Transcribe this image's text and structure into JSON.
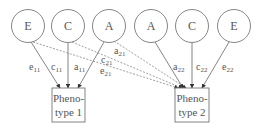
{
  "diagram": {
    "type": "path-diagram",
    "colors": {
      "stroke": "#777777",
      "text": "#555555",
      "arrow": "#333333"
    },
    "latent_factors": [
      {
        "id": "E1",
        "label": "E",
        "cx": 28,
        "cy": 26
      },
      {
        "id": "C1",
        "label": "C",
        "cx": 68,
        "cy": 26
      },
      {
        "id": "A1",
        "label": "A",
        "cx": 109,
        "cy": 26
      },
      {
        "id": "A2",
        "label": "A",
        "cx": 151,
        "cy": 26
      },
      {
        "id": "C2",
        "label": "C",
        "cx": 192,
        "cy": 26
      },
      {
        "id": "E2",
        "label": "E",
        "cx": 234,
        "cy": 26
      }
    ],
    "phenotypes": [
      {
        "id": "P1",
        "line1": "Pheno-",
        "line2": "type 1"
      },
      {
        "id": "P2",
        "line1": "Pheno-",
        "line2": "type 2"
      }
    ],
    "paths": [
      {
        "from": "E1",
        "to": "P1",
        "style": "solid",
        "label": "e",
        "sub": "11"
      },
      {
        "from": "C1",
        "to": "P1",
        "style": "solid",
        "label": "c",
        "sub": "11"
      },
      {
        "from": "A1",
        "to": "P1",
        "style": "solid",
        "label": "a",
        "sub": "11"
      },
      {
        "from": "A1",
        "to": "P2",
        "style": "dashed",
        "label": "a",
        "sub": "21"
      },
      {
        "from": "C1",
        "to": "P2",
        "style": "dashed",
        "label": "c",
        "sub": "21"
      },
      {
        "from": "E1",
        "to": "P2",
        "style": "dashed",
        "label": "e",
        "sub": "21"
      },
      {
        "from": "A2",
        "to": "P2",
        "style": "solid",
        "label": "a",
        "sub": "22"
      },
      {
        "from": "C2",
        "to": "P2",
        "style": "solid",
        "label": "c",
        "sub": "22"
      },
      {
        "from": "E2",
        "to": "P2",
        "style": "solid",
        "label": "e",
        "sub": "22"
      }
    ]
  }
}
